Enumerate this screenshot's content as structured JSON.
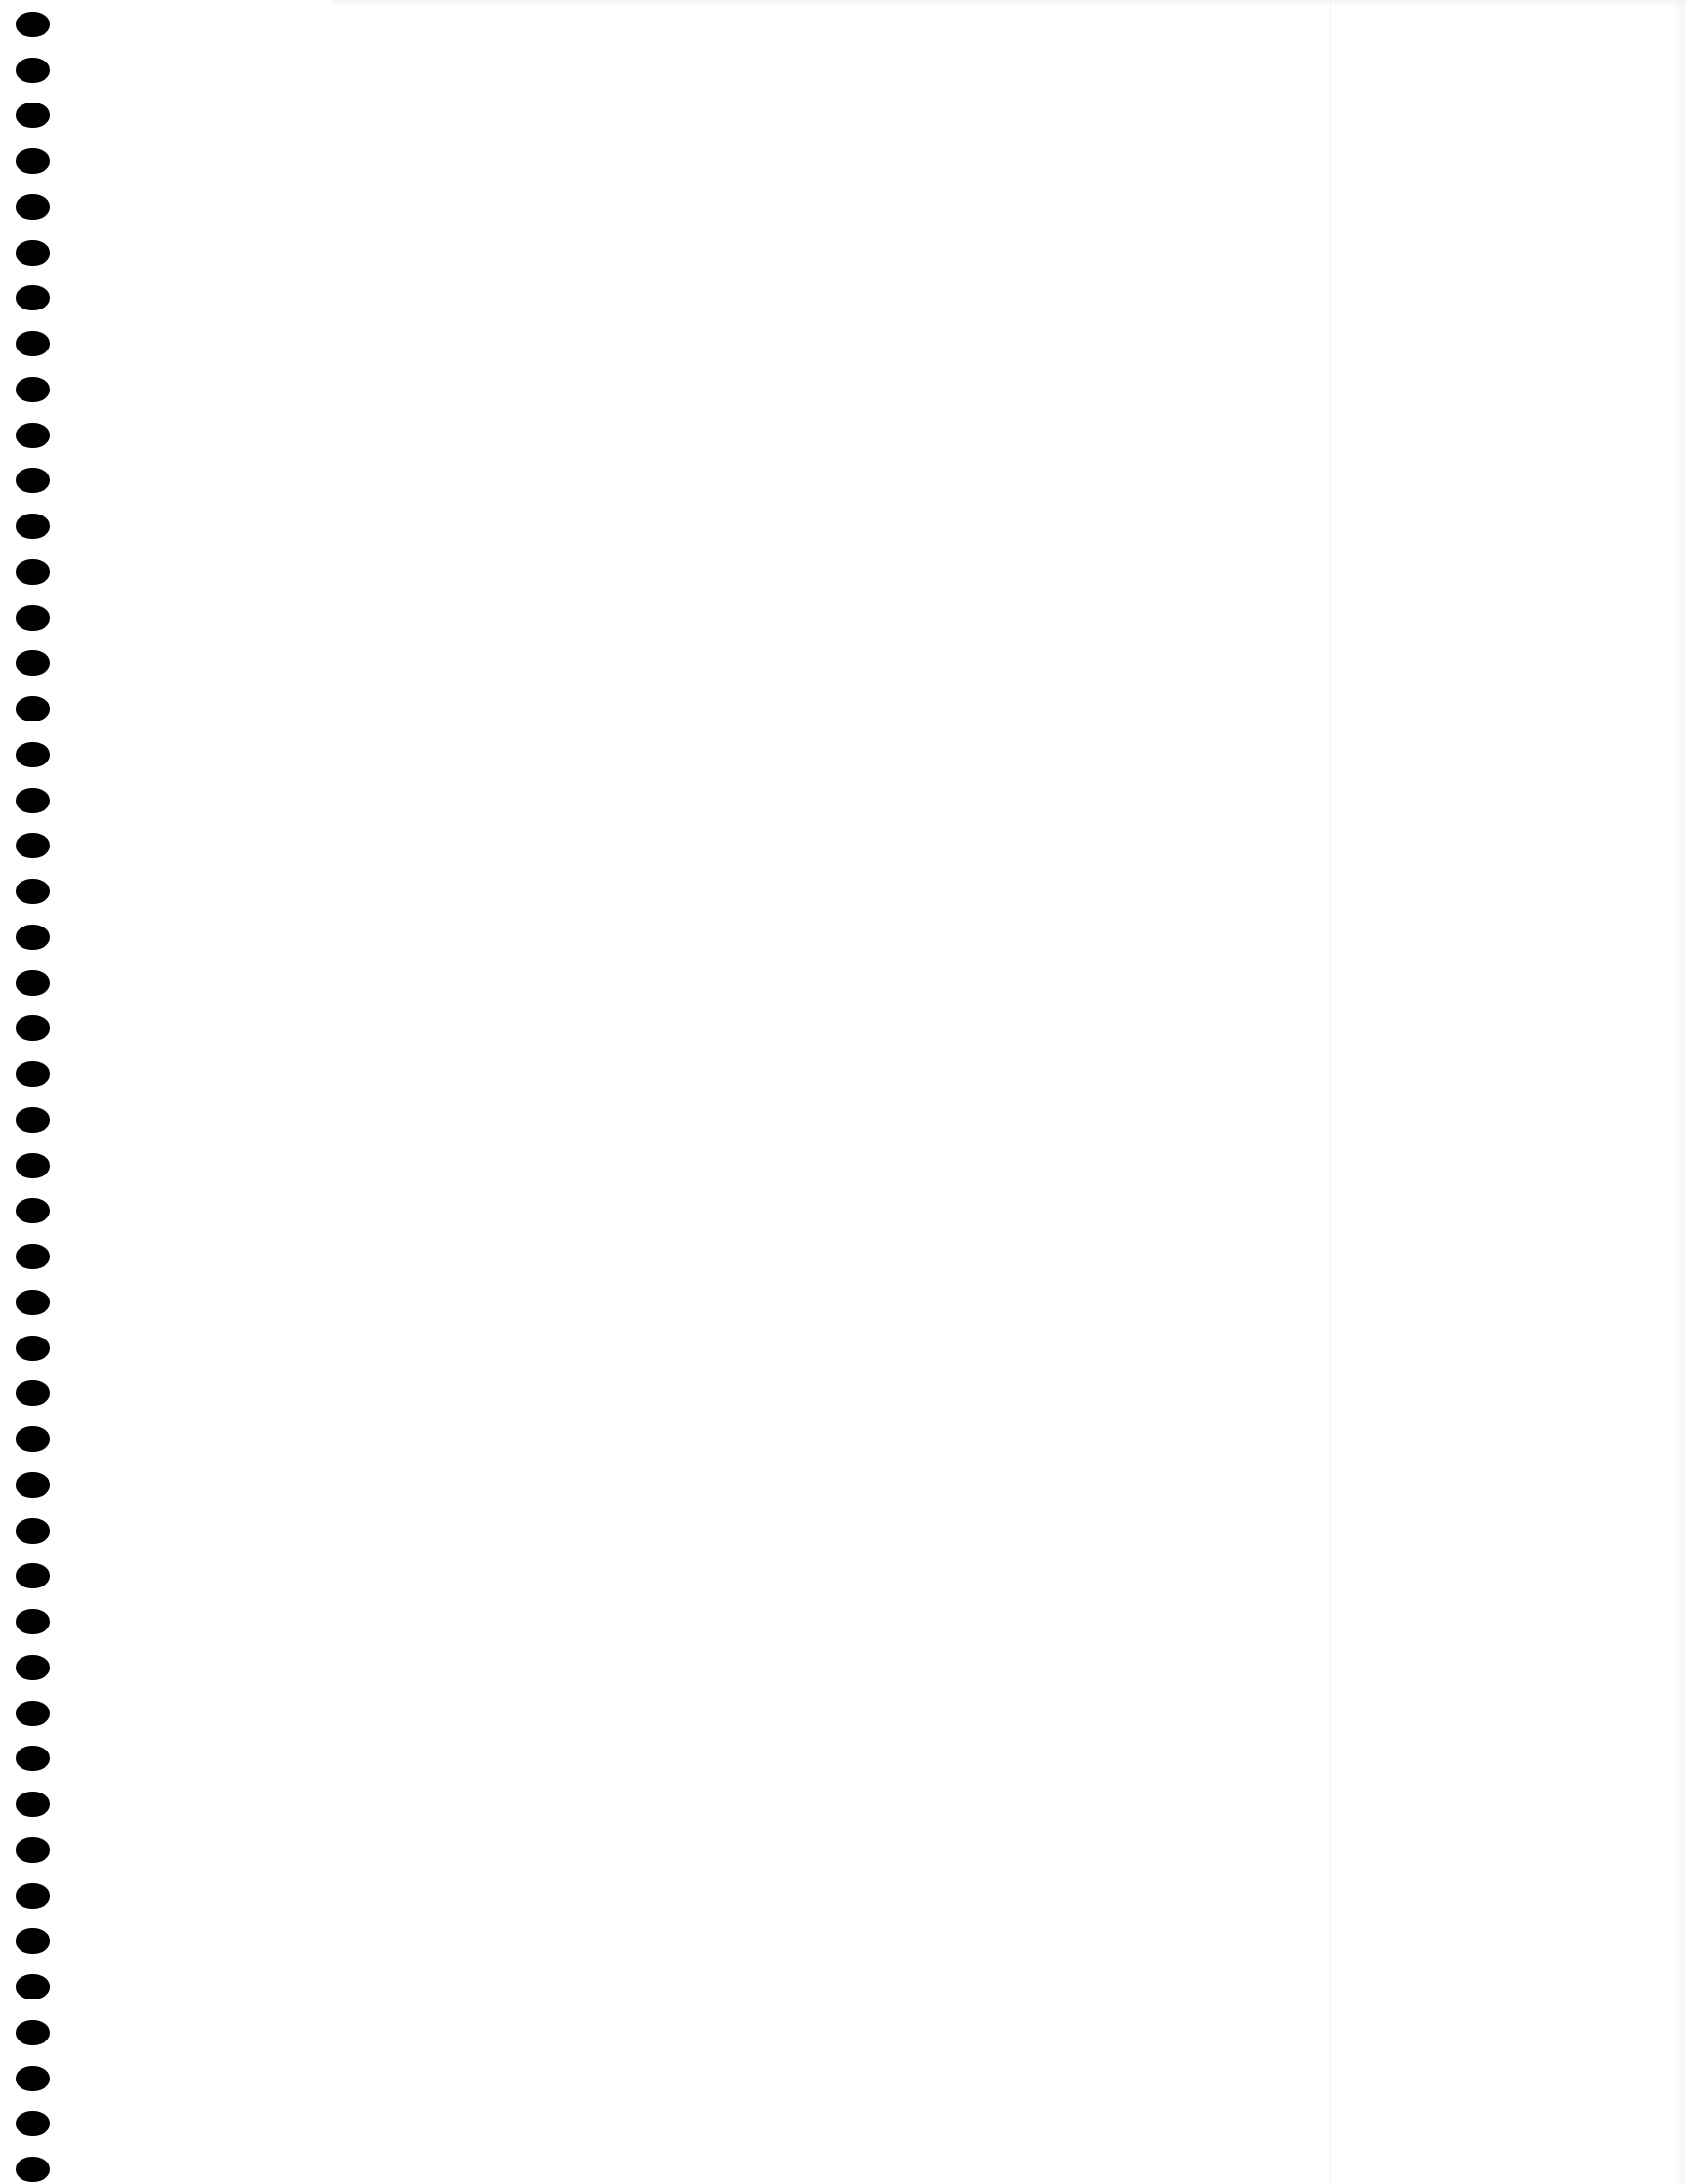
{
  "document": {
    "type": "blank scanned page",
    "text_content": "",
    "binding": {
      "style": "spiral/binder holes along left edge",
      "hole_count": 48,
      "hole_color": "#000000",
      "first_hole_center_y": 25,
      "last_hole_center_y": 2222,
      "hole_center_x": 33
    },
    "background_color": "#ffffff"
  }
}
